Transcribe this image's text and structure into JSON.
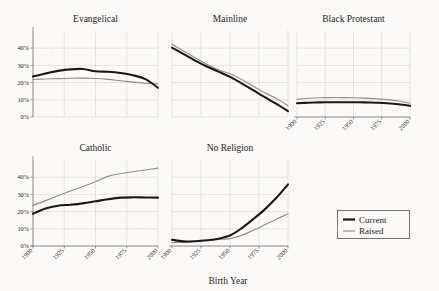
{
  "figure": {
    "xlabel": "Birth Year",
    "ylabel": "",
    "xticks": [
      "1900",
      "1925",
      "1950",
      "1975",
      "2000"
    ],
    "yticks": [
      "0%",
      "10%",
      "20%",
      "30%",
      "40%"
    ]
  },
  "legend": {
    "position": "bottom-right",
    "entries": [
      {
        "name": "Current",
        "color": "#1b1817",
        "style": "thick-black"
      },
      {
        "name": "Raised",
        "color": "#8f8d8a",
        "style": "thin-gray"
      }
    ]
  },
  "chart_data": {
    "type": "line",
    "title": "",
    "xlabel": "Birth Year",
    "ylabel": "",
    "xlim": [
      1900,
      2000
    ],
    "ylim": [
      0,
      50
    ],
    "grid": true,
    "x": [
      1900,
      1910,
      1920,
      1930,
      1940,
      1950,
      1960,
      1970,
      1980,
      1990,
      2000
    ],
    "panels": [
      {
        "title": "Evangelical",
        "row": 1,
        "col": 1,
        "yticks": [
          0,
          10,
          20,
          30,
          40
        ],
        "ytick_labels": [
          "0%",
          "10%",
          "20%",
          "30%",
          "40%"
        ],
        "xtick_labels_shown": false,
        "series": [
          {
            "name": "Current",
            "color": "#1b1817",
            "values": [
              23.5,
              25.3,
              26.8,
              27.7,
              27.9,
              26.6,
              26.3,
              25.6,
              24.3,
              22.0,
              17.0
            ]
          },
          {
            "name": "Raised",
            "color": "#8f8d8a",
            "values": [
              21.8,
              22.1,
              22.3,
              22.5,
              22.6,
              22.4,
              21.9,
              21.1,
              20.3,
              19.6,
              19.3
            ]
          }
        ]
      },
      {
        "title": "Mainline",
        "row": 1,
        "col": 2,
        "yticks": [
          0,
          10,
          20,
          30,
          40
        ],
        "xtick_labels_shown": false,
        "series": [
          {
            "name": "Current",
            "color": "#1b1817",
            "values": [
              40.3,
              36.6,
              32.8,
              29.4,
              26.4,
              23.3,
              19.6,
              15.6,
              11.5,
              7.6,
              3.4
            ]
          },
          {
            "name": "Raised",
            "color": "#8f8d8a",
            "values": [
              42.3,
              38.4,
              34.4,
              30.7,
              27.5,
              25.1,
              21.8,
              17.9,
              14.1,
              10.7,
              6.6
            ]
          }
        ]
      },
      {
        "title": "Black Protestant",
        "row": 1,
        "col": 3,
        "yticks": [
          0,
          10,
          20,
          30,
          40
        ],
        "xtick_labels_shown": true,
        "series": [
          {
            "name": "Current",
            "color": "#1b1817",
            "values": [
              8.0,
              8.3,
              8.5,
              8.6,
              8.6,
              8.6,
              8.5,
              8.3,
              8.0,
              7.4,
              6.5
            ]
          },
          {
            "name": "Raised",
            "color": "#8f8d8a",
            "values": [
              10.3,
              10.9,
              11.2,
              11.3,
              11.3,
              11.2,
              11.0,
              10.6,
              10.1,
              9.3,
              8.0
            ]
          }
        ]
      },
      {
        "title": "Catholic",
        "row": 2,
        "col": 1,
        "yticks": [
          0,
          10,
          20,
          30,
          40
        ],
        "xtick_labels_shown": true,
        "series": [
          {
            "name": "Current",
            "color": "#1b1817",
            "values": [
              18.8,
              21.8,
              23.4,
              24.0,
              24.8,
              26.0,
              27.2,
              28.1,
              28.3,
              28.2,
              28.1
            ]
          },
          {
            "name": "Raised",
            "color": "#8f8d8a",
            "values": [
              23.6,
              26.4,
              29.2,
              32.0,
              34.6,
              37.4,
              40.5,
              42.0,
              43.2,
              44.2,
              45.3
            ]
          }
        ]
      },
      {
        "title": "No Religion",
        "row": 2,
        "col": 2,
        "yticks": [
          0,
          10,
          20,
          30,
          40
        ],
        "xtick_labels_shown": true,
        "series": [
          {
            "name": "Current",
            "color": "#1b1817",
            "values": [
              3.6,
              2.7,
              2.8,
              3.3,
              4.2,
              6.1,
              10.3,
              15.6,
              21.3,
              28.0,
              35.8
            ]
          },
          {
            "name": "Raised",
            "color": "#8f8d8a",
            "values": [
              2.0,
              2.1,
              2.6,
              3.2,
              3.8,
              4.3,
              6.2,
              9.1,
              12.3,
              15.6,
              18.8
            ]
          }
        ]
      }
    ]
  }
}
